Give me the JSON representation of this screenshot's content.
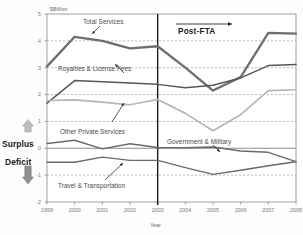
{
  "chart_data": {
    "type": "line",
    "title": "",
    "xlabel": "Year",
    "ylabel": "$Billion",
    "unit_label": "$Billion",
    "x": [
      1999,
      2000,
      2001,
      2002,
      2003,
      2004,
      2005,
      2006,
      2007,
      2008
    ],
    "xtick_labels": [
      "1999",
      "2000",
      "2001",
      "2002",
      "2003",
      "2004",
      "2005",
      "2006",
      "2007",
      "2008"
    ],
    "ytick_labels": [
      "5",
      "4",
      "3",
      "2",
      "1",
      "0",
      "-1",
      "-2"
    ],
    "ytick_values": [
      5,
      4,
      3,
      2,
      1,
      0,
      -1,
      -2
    ],
    "ylim": [
      -2,
      5
    ],
    "xlim": [
      1999,
      2008
    ],
    "grid": "horizontal-dashed",
    "legend": "inline-annotations",
    "series": [
      {
        "name": "Total Services",
        "color": "#6e6e6e",
        "width": 2.3,
        "values": [
          3.05,
          4.15,
          4.0,
          3.72,
          3.8,
          3.0,
          2.15,
          2.65,
          4.3,
          4.27
        ]
      },
      {
        "name": "Royalties & License Fees",
        "color": "#575757",
        "width": 1.5,
        "values": [
          1.68,
          2.52,
          2.48,
          2.43,
          2.38,
          2.25,
          2.35,
          2.62,
          3.08,
          3.12
        ]
      },
      {
        "name": "Other Private Services",
        "color": "#b6b6b6",
        "width": 1.7,
        "values": [
          1.78,
          1.8,
          1.72,
          1.62,
          1.82,
          1.3,
          0.65,
          1.25,
          2.15,
          2.18
        ]
      },
      {
        "name": "Government & Military",
        "color": "#6a6a6a",
        "width": 1.4,
        "values": [
          0.18,
          0.3,
          -0.02,
          0.17,
          0.03,
          0.02,
          0.05,
          -0.1,
          -0.15,
          -0.5
        ]
      },
      {
        "name": "Travel & Transportation",
        "color": "#6a6a6a",
        "width": 1.4,
        "values": [
          -0.52,
          -0.52,
          -0.33,
          -0.45,
          -0.45,
          -0.72,
          -0.97,
          -0.82,
          -0.65,
          -0.5
        ]
      }
    ],
    "annotations": [
      {
        "id": "post-fta",
        "text": "Post-FTA",
        "type": "arrow-right"
      },
      {
        "id": "fta-line",
        "text": "",
        "x": 2003,
        "type": "vline"
      },
      {
        "id": "surplus",
        "text": "Surplus",
        "type": "axis-side-up"
      },
      {
        "id": "deficit",
        "text": "Deficit",
        "type": "axis-side-down"
      }
    ],
    "series_labels": [
      {
        "name": "Total Services"
      },
      {
        "name": "Royalties & License Fees"
      },
      {
        "name": "Other Private Services"
      },
      {
        "name": "Government & Military"
      },
      {
        "name": "Travel & Transportation"
      }
    ]
  },
  "axes": {
    "unit": "$Billion",
    "x_title": "Year",
    "yticks": [
      "5",
      "4",
      "3",
      "2",
      "1",
      "0",
      "-1",
      "-2"
    ],
    "xticks": [
      "1999",
      "2000",
      "2001",
      "2002",
      "2003",
      "2004",
      "2005",
      "2006",
      "2007",
      "2008"
    ]
  },
  "labels": {
    "total_services": "Total Services",
    "royalties": "Royalties & License Fees",
    "other_private": "Other Private Services",
    "government": "Government & Military",
    "travel": "Travel & Transportation",
    "post_fta": "Post-FTA",
    "surplus": "Surplus",
    "deficit": "Deficit"
  },
  "colors": {
    "total_services": "#6e6e6e",
    "royalties": "#575757",
    "other_private": "#b6b6b6",
    "government": "#6a6a6a",
    "travel": "#6a6a6a",
    "grid": "#9a9a9a",
    "axis": "#8a8a8a",
    "text": "#3a3a3a"
  }
}
